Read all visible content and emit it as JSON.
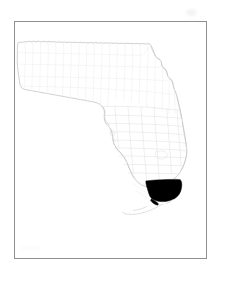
{
  "figure": {
    "kind": "locator-map",
    "title": "",
    "caption": "",
    "background_color": "#ffffff",
    "frame": {
      "visible": true,
      "color": "#8d8f92",
      "thickness_px": 1,
      "x": 14,
      "y": 21,
      "width": 193,
      "height": 238
    },
    "artifacts": [
      {
        "name": "scan-smudge-top-right",
        "color": "#f2f2f2"
      },
      {
        "name": "scan-smudge-bottom-left",
        "color": "#fbfbfb"
      }
    ]
  },
  "map": {
    "region_name": "Florida",
    "projection_note": "",
    "state_outline": {
      "name": "florida-state-outline",
      "stroke_color": "#b9bbbd"
    },
    "county_boundaries": {
      "name": "florida-county-boundaries",
      "stroke_color": "#dcdee0",
      "visible": true
    },
    "islands": {
      "name": "florida-keys",
      "stroke_color": "#c9cbcd",
      "visible": true
    },
    "highlight": {
      "name": "miami-dade-county",
      "label": "Miami-Dade County",
      "fill_color": "#000000",
      "position_description": "southeastern tip of the Florida peninsula",
      "visible": true
    },
    "legend": {
      "visible": false,
      "entries": []
    },
    "scale_bar": {
      "visible": false
    },
    "north_arrow": {
      "visible": false
    },
    "labels": []
  },
  "chart_data": {
    "type": "map",
    "categories": [
      "Miami-Dade County",
      "Other Florida counties"
    ],
    "values": [
      1,
      0
    ],
    "series": [
      {
        "name": "highlighted",
        "values": [
          1,
          0
        ],
        "color": "#000000"
      },
      {
        "name": "not highlighted",
        "values": [
          0,
          1
        ],
        "color": "#ffffff"
      }
    ],
    "legend_position": "none",
    "grid": false,
    "xlabel": "",
    "ylabel": ""
  }
}
